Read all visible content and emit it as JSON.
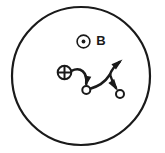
{
  "figure": {
    "kind": "physics-diagram",
    "width": 165,
    "height": 153,
    "background_color": "#ffffff",
    "ink_color": "#1a1a1a"
  },
  "boundary": {
    "name": "outer-circle",
    "shape": "circle",
    "center_x": 81,
    "center_y": 76,
    "radius": 69,
    "stroke_width": 2.2,
    "fill": "none"
  },
  "field_symbol": {
    "name": "magnetic-field-out-of-page",
    "glyph": "circle-dot",
    "meaning": "field directed out of the page",
    "center_x": 83.5,
    "center_y": 41.5,
    "outer_radius": 6.4,
    "dot_radius": 1.9,
    "stroke_width": 1.6
  },
  "field_label": {
    "name": "field-label-B",
    "text": "B",
    "x": 101,
    "y": 41.5,
    "font_size": 13,
    "font_weight": "bold"
  },
  "source_symbol": {
    "name": "positive-charge-source",
    "glyph": "circle-plus",
    "meaning": "positive charge",
    "center_x": 64.5,
    "center_y": 72.5,
    "radius": 6.8,
    "stroke_width": 2.0
  },
  "trajectories": [
    {
      "name": "trajectory-first-arc",
      "description": "arc from the positive charge curving right and down into the first node",
      "path": "M 71.5 70.8 C 80.5 66.5 87.5 72.0 86.2 84.0",
      "stroke_width": 2.6,
      "arrowhead": {
        "name": "arrowhead-down-into-first-node",
        "tip_x": 86.2,
        "tip_y": 85.5,
        "angle_deg": 100,
        "length": 9.5,
        "width": 7.0
      }
    },
    {
      "name": "trajectory-second-arc",
      "description": "arc leaving the first node to the right, rising toward the branch point",
      "path": "M 89.5 89.0 C 98.0 86.5 104.0 83.5 110.0 74.5",
      "stroke_width": 2.6,
      "arrowhead": null
    },
    {
      "name": "trajectory-escape-branch",
      "description": "branch rising up and to the right out of the turning point",
      "path": "M 110.0 74.5 C 111.5 70.0 114.5 66.0 119.5 62.0",
      "stroke_width": 2.4,
      "arrowhead": {
        "name": "arrowhead-up-right-escape",
        "tip_x": 122.5,
        "tip_y": 59.5,
        "angle_deg": -40,
        "length": 11.5,
        "width": 7.0
      }
    },
    {
      "name": "trajectory-return-branch",
      "description": "branch descending to the right from the turning point into the second node",
      "path": "M 110.0 74.5 C 111.5 79.5 113.5 84.0 116.0 88.0",
      "stroke_width": 2.4,
      "arrowhead": {
        "name": "arrowhead-down-right-into-second-node",
        "tip_x": 118.0,
        "tip_y": 91.0,
        "angle_deg": 56,
        "length": 12.0,
        "width": 7.0
      }
    }
  ],
  "nodes": [
    {
      "name": "node-first",
      "glyph": "open-circle",
      "center_x": 86.3,
      "center_y": 90.0,
      "radius": 4.0,
      "stroke_width": 2.0,
      "fill": "#ffffff"
    },
    {
      "name": "node-second",
      "glyph": "open-circle",
      "center_x": 120.0,
      "center_y": 94.0,
      "radius": 4.0,
      "stroke_width": 2.0,
      "fill": "#ffffff"
    }
  ]
}
